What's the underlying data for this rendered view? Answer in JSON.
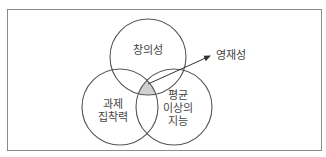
{
  "diagram": {
    "type": "venn",
    "circles": [
      {
        "id": "creativity",
        "label": "창의성",
        "cx": 148,
        "cy": 57,
        "r": 38
      },
      {
        "id": "task-commitment",
        "label_lines": [
          "과제",
          "집착력"
        ],
        "cx": 120,
        "cy": 107,
        "r": 38
      },
      {
        "id": "above-average-ability",
        "label_lines": [
          "평균",
          "이상의",
          "지능"
        ],
        "cx": 174,
        "cy": 107,
        "r": 38
      }
    ],
    "intersection": {
      "label": "영재성",
      "fill": "#d0d0d0"
    },
    "colors": {
      "stroke": "#555555",
      "frame": "#8a8a8a",
      "text": "#444444"
    }
  }
}
